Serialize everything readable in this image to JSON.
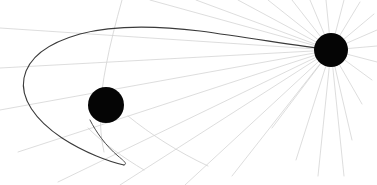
{
  "diagram": {
    "background_color": "#ffffff",
    "width": 377,
    "height": 185,
    "bodies": [
      {
        "name": "planet",
        "label": "Planet",
        "cx": 106,
        "cy": 105,
        "r": 18,
        "color": "#050505"
      },
      {
        "name": "star",
        "label": "Star",
        "cx": 331,
        "cy": 50,
        "r": 17,
        "color": "#050505"
      }
    ],
    "trajectory": {
      "name": "spacecraft-trajectory",
      "color": "#3a3a3a",
      "stroke_width": 1.1,
      "main_path": "M 331 50 C 300 46, 250 38, 200 31 C 150 25, 110 26, 80 34 C 48 43, 28 58, 24 78 C 20 98, 35 120, 62 138 C 85 153, 110 162, 124 165",
      "tail_path": "M 90 120 C 96 132, 106 146, 118 156 C 124 161, 128 164, 124 165"
    },
    "rays": {
      "name": "star-rays",
      "color": "#cfcfcf",
      "stroke_width": 0.7,
      "origin": {
        "x": 331,
        "y": 50
      },
      "endpoints": [
        {
          "x": 0,
          "y": 28
        },
        {
          "x": 0,
          "y": 68
        },
        {
          "x": 0,
          "y": 110
        },
        {
          "x": 18,
          "y": 152
        },
        {
          "x": 58,
          "y": 182
        },
        {
          "x": 120,
          "y": 185
        },
        {
          "x": 185,
          "y": 185
        },
        {
          "x": 232,
          "y": 176
        },
        {
          "x": 150,
          "y": 0
        },
        {
          "x": 196,
          "y": 0
        },
        {
          "x": 238,
          "y": 0
        },
        {
          "x": 268,
          "y": 0
        },
        {
          "x": 292,
          "y": 0
        },
        {
          "x": 310,
          "y": 0
        },
        {
          "x": 326,
          "y": 0
        },
        {
          "x": 344,
          "y": 0
        },
        {
          "x": 360,
          "y": 2
        },
        {
          "x": 374,
          "y": 14
        },
        {
          "x": 377,
          "y": 30
        },
        {
          "x": 377,
          "y": 46
        },
        {
          "x": 377,
          "y": 62
        },
        {
          "x": 372,
          "y": 80
        },
        {
          "x": 362,
          "y": 104
        },
        {
          "x": 352,
          "y": 140
        },
        {
          "x": 344,
          "y": 176
        },
        {
          "x": 318,
          "y": 176
        },
        {
          "x": 296,
          "y": 160
        },
        {
          "x": 272,
          "y": 128
        }
      ]
    },
    "faint_curves": [
      {
        "name": "orbit-arc-through-planet",
        "path": "M 122 0 C 116 22, 110 44, 106 66 C 100 96, 98 126, 104 152"
      },
      {
        "name": "orbit-arc-lower",
        "path": "M 128 116 C 150 134, 178 152, 208 166"
      },
      {
        "name": "orbit-arc-left-lower",
        "path": "M 88 128 C 104 144, 124 158, 144 170"
      }
    ]
  }
}
